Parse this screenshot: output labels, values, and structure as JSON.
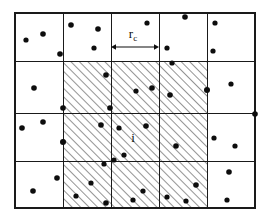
{
  "figure": {
    "kind": "cell-list-diagram",
    "width": 268,
    "height": 219,
    "background_color": "#ffffff",
    "line_color": "#1a1a1a",
    "particle_color": "#0d0d0d",
    "hatch_color": "#3a3a3a"
  },
  "labels": {
    "cutoff_radius": "r",
    "cutoff_radius_subscript": "c",
    "center_cell": "i"
  },
  "grid": {
    "columns": 5,
    "rows": 4,
    "x_lines": [
      15,
      63,
      111,
      159,
      207,
      255
    ],
    "y_lines": [
      13,
      61,
      113,
      161,
      208
    ],
    "highlighted_block": {
      "col_start": 1,
      "col_end": 3,
      "row_start": 1,
      "row_end": 3,
      "fill": "hatched",
      "hatch_angle_deg": 45
    }
  },
  "hatched_cells": [
    {
      "col": 1,
      "row": 1
    },
    {
      "col": 2,
      "row": 1
    },
    {
      "col": 3,
      "row": 1
    },
    {
      "col": 1,
      "row": 2
    },
    {
      "col": 2,
      "row": 2
    },
    {
      "col": 3,
      "row": 2
    },
    {
      "col": 1,
      "row": 3
    },
    {
      "col": 2,
      "row": 3
    },
    {
      "col": 3,
      "row": 3
    }
  ],
  "cutoff_arrow": {
    "x_start": 111,
    "x_end": 159,
    "y": 47,
    "label_x": 133,
    "label_y": 38,
    "double_headed": true
  },
  "center_label": {
    "x": 133,
    "y": 142
  },
  "particles": [
    {
      "x": 26,
      "y": 40,
      "r": 2.6
    },
    {
      "x": 43,
      "y": 34,
      "r": 2.8
    },
    {
      "x": 60,
      "y": 54,
      "r": 2.8
    },
    {
      "x": 71,
      "y": 25,
      "r": 2.8
    },
    {
      "x": 98,
      "y": 29,
      "r": 2.8
    },
    {
      "x": 94,
      "y": 48,
      "r": 2.6
    },
    {
      "x": 147,
      "y": 23,
      "r": 2.6
    },
    {
      "x": 185,
      "y": 17,
      "r": 2.8
    },
    {
      "x": 167,
      "y": 48,
      "r": 2.6
    },
    {
      "x": 215,
      "y": 23,
      "r": 2.6
    },
    {
      "x": 213,
      "y": 51,
      "r": 2.6
    },
    {
      "x": 34,
      "y": 88,
      "r": 2.8
    },
    {
      "x": 106,
      "y": 75,
      "r": 2.8
    },
    {
      "x": 63,
      "y": 108,
      "r": 2.8
    },
    {
      "x": 110,
      "y": 108,
      "r": 2.8
    },
    {
      "x": 136,
      "y": 91,
      "r": 2.6
    },
    {
      "x": 152,
      "y": 88,
      "r": 2.8
    },
    {
      "x": 170,
      "y": 95,
      "r": 2.8
    },
    {
      "x": 172,
      "y": 63,
      "r": 2.6
    },
    {
      "x": 207,
      "y": 90,
      "r": 3.0
    },
    {
      "x": 231,
      "y": 84,
      "r": 2.6
    },
    {
      "x": 22,
      "y": 128,
      "r": 2.8
    },
    {
      "x": 43,
      "y": 122,
      "r": 2.8
    },
    {
      "x": 63,
      "y": 142,
      "r": 3.0
    },
    {
      "x": 101,
      "y": 125,
      "r": 2.8
    },
    {
      "x": 114,
      "y": 160,
      "r": 2.6
    },
    {
      "x": 119,
      "y": 128,
      "r": 2.6
    },
    {
      "x": 146,
      "y": 126,
      "r": 2.8
    },
    {
      "x": 124,
      "y": 155,
      "r": 2.6
    },
    {
      "x": 176,
      "y": 146,
      "r": 2.8
    },
    {
      "x": 214,
      "y": 138,
      "r": 2.6
    },
    {
      "x": 235,
      "y": 146,
      "r": 2.6
    },
    {
      "x": 255,
      "y": 114,
      "r": 2.8
    },
    {
      "x": 33,
      "y": 191,
      "r": 2.8
    },
    {
      "x": 57,
      "y": 178,
      "r": 2.8
    },
    {
      "x": 91,
      "y": 183,
      "r": 2.6
    },
    {
      "x": 76,
      "y": 196,
      "r": 2.6
    },
    {
      "x": 104,
      "y": 164,
      "r": 2.6
    },
    {
      "x": 106,
      "y": 203,
      "r": 2.8
    },
    {
      "x": 143,
      "y": 191,
      "r": 2.6
    },
    {
      "x": 133,
      "y": 200,
      "r": 2.6
    },
    {
      "x": 167,
      "y": 197,
      "r": 2.6
    },
    {
      "x": 196,
      "y": 185,
      "r": 2.8
    },
    {
      "x": 186,
      "y": 201,
      "r": 2.6
    },
    {
      "x": 229,
      "y": 172,
      "r": 2.8
    },
    {
      "x": 227,
      "y": 200,
      "r": 2.6
    }
  ]
}
